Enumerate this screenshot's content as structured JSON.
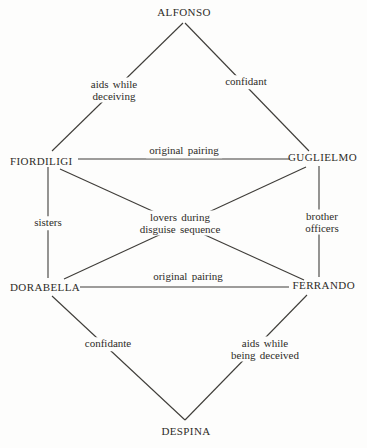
{
  "diagram": {
    "nodes": [
      {
        "id": "alfonso",
        "label": "ALFONSO"
      },
      {
        "id": "fiordiligi",
        "label": "FIORDILIGI"
      },
      {
        "id": "guglielmo",
        "label": "GUGLIELMO"
      },
      {
        "id": "dorabella",
        "label": "DORABELLA"
      },
      {
        "id": "ferrando",
        "label": "FERRANDO"
      },
      {
        "id": "despina",
        "label": "DESPINA"
      }
    ],
    "edges": [
      {
        "from": "ALFONSO",
        "to": "FIORDILIGI",
        "label": "aids while\ndeceiving"
      },
      {
        "from": "ALFONSO",
        "to": "GUGLIELMO",
        "label": "confidant"
      },
      {
        "from": "FIORDILIGI",
        "to": "GUGLIELMO",
        "label": "original pairing"
      },
      {
        "from": "FIORDILIGI",
        "to": "DORABELLA",
        "label": "sisters"
      },
      {
        "from": "GUGLIELMO",
        "to": "FERRANDO",
        "label": "brother\nofficers"
      },
      {
        "from": "FIORDILIGI",
        "to": "FERRANDO",
        "label": "lovers during\ndisguise sequence"
      },
      {
        "from": "GUGLIELMO",
        "to": "DORABELLA",
        "label": "lovers during\ndisguise sequence"
      },
      {
        "from": "DORABELLA",
        "to": "FERRANDO",
        "label": "original pairing"
      },
      {
        "from": "DORABELLA",
        "to": "DESPINA",
        "label": "confidante"
      },
      {
        "from": "FERRANDO",
        "to": "DESPINA",
        "label": "aids while\nbeing deceived"
      }
    ],
    "colors": {
      "background": "#fdfdfc",
      "text": "#2e2c28",
      "line": "#3f3d39"
    }
  }
}
